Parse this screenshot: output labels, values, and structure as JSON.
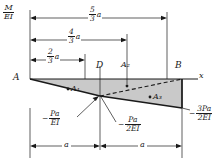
{
  "figure": {
    "axis_label": "x",
    "vertical_axis": {
      "num": "M",
      "den": "EI"
    },
    "points": {
      "a": "A",
      "d": "D",
      "b": "B"
    },
    "areas": {
      "a1": "A₁",
      "a2": "A₂",
      "a3": "A₃"
    },
    "dimensions_top": [
      {
        "num": "5",
        "den": "3",
        "suffix": "a"
      },
      {
        "num": "4",
        "den": "3",
        "suffix": "a"
      },
      {
        "num": "2",
        "den": "3",
        "suffix": "a"
      }
    ],
    "dimensions_bottom": [
      {
        "label": "a"
      },
      {
        "label": "a"
      }
    ],
    "values": [
      {
        "sign": "−",
        "num": "Pa",
        "den": "EI"
      },
      {
        "sign": "−",
        "num": "Pa",
        "den": "2EI"
      },
      {
        "sign": "−",
        "num": "3Pa",
        "den": "2EI"
      }
    ],
    "colors": {
      "line": "#1a1a1a",
      "fill": "#c9c9c9",
      "background": "#ffffff"
    }
  }
}
